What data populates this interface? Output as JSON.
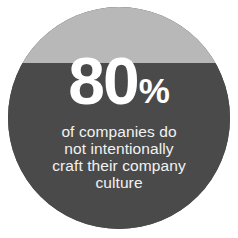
{
  "graphic": {
    "type": "statistic-circle-callout",
    "shape": "circle",
    "background_color": "#ffffff",
    "band_top_color": "#b8b8b8",
    "band_bottom_color": "#4a4a4a",
    "text_color": "#ffffff",
    "caption_color": "#f2f2f2"
  },
  "statistic": {
    "number": "80",
    "unit": "%",
    "full_value": "80%"
  },
  "caption": {
    "full_text": "of companies do not intentionally craft their company culture",
    "lines": [
      "of companies do",
      "not intentionally",
      "craft their company",
      "culture"
    ]
  },
  "chart_data": {
    "type": "pie",
    "categories": [
      "Do not intentionally craft company culture",
      "Intentionally craft company culture"
    ],
    "values": [
      80,
      20
    ],
    "value_labels": [
      "80%",
      "20%"
    ],
    "units": "percent",
    "xlabel": "",
    "ylabel": "",
    "legend": "none",
    "grid": false,
    "annotations": [
      "80%",
      "of companies do",
      "not intentionally",
      "craft their company",
      "culture"
    ],
    "colors": [
      "#4a4a4a",
      "#b8b8b8"
    ]
  }
}
